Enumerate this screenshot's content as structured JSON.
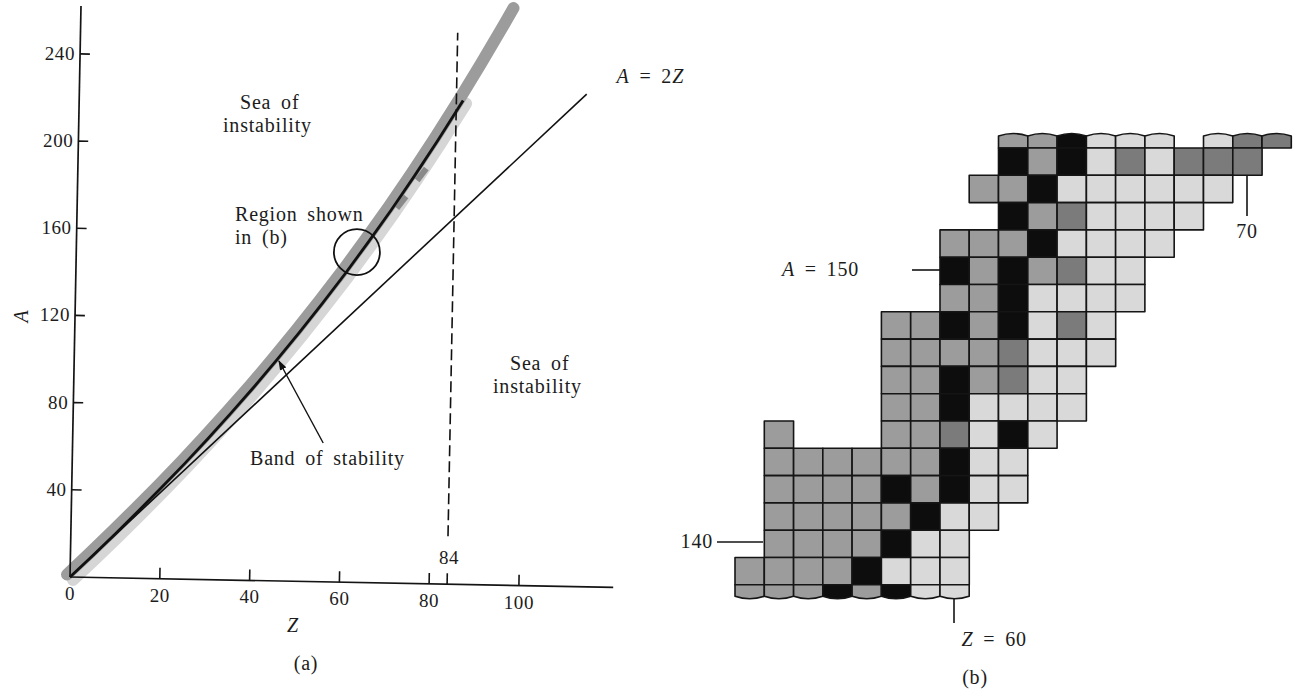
{
  "figure": {
    "panel_a": {
      "caption": "(a)",
      "x_axis_label": "Z",
      "y_axis_label": "A",
      "sea_upper": {
        "line1": "Sea of",
        "line2": "instability"
      },
      "region": {
        "line1": "Region shown",
        "line2": "in (b)"
      },
      "sea_lower": {
        "line1": "Sea of",
        "line2": "instability"
      },
      "band_label": "Band of stability",
      "line_label": {
        "lhs": "A",
        "mid": " = 2",
        "rhs": "Z"
      }
    },
    "panel_b": {
      "caption": "(b)",
      "a150_label": {
        "var": "A",
        "rest": " = 150"
      },
      "a140_label": "140",
      "z60_label": {
        "var": "Z",
        "rest": " = 60"
      },
      "z70_label": "70"
    }
  },
  "chart_data": [
    {
      "id": "a",
      "type": "line",
      "title": "(a)",
      "xlabel": "Z",
      "ylabel": "A",
      "xlim": [
        0,
        121
      ],
      "ylim": [
        0,
        262
      ],
      "grid": false,
      "legend": null,
      "xticks": [
        0,
        20,
        40,
        60,
        80,
        100
      ],
      "xtick_labels": [
        "0",
        "20",
        "40",
        "60",
        "80",
        "100"
      ],
      "extra_xticks": [
        84
      ],
      "extra_xtick_labels": [
        "84"
      ],
      "yticks": [
        40,
        80,
        120,
        160,
        200,
        240
      ],
      "ytick_labels": [
        "40",
        "80",
        "120",
        "160",
        "200",
        "240"
      ],
      "series": [
        {
          "name": "Band of stability",
          "style": "black curve over gray band",
          "color": "#111111",
          "band_color": "#9c9c9c",
          "halo_color": "#d6d6d6",
          "x": [
            0,
            5,
            10,
            15,
            20,
            25,
            30,
            35,
            40,
            45,
            50,
            55,
            60,
            65,
            70,
            75,
            80,
            85.5
          ],
          "y": [
            0,
            10.1,
            20.4,
            31.0,
            41.8,
            52.9,
            64.4,
            76.2,
            88.4,
            101.0,
            114.1,
            127.6,
            141.6,
            156.2,
            171.3,
            187.0,
            203.3,
            222.0
          ]
        },
        {
          "name": "Band of stability (gray band extension)",
          "style": "gray band only",
          "x": [
            90,
            95,
            97
          ],
          "y": [
            237.9,
            256.2,
            263.7
          ]
        },
        {
          "name": "A = 2Z",
          "style": "solid",
          "color": "#111111",
          "x": [
            0,
            113
          ],
          "y": [
            0,
            226
          ]
        },
        {
          "name": "Z = 84",
          "style": "dashed",
          "color": "#111111",
          "x": [
            84,
            84
          ],
          "y": [
            22,
            253
          ]
        }
      ],
      "band_marks": [
        {
          "x": 71.2,
          "y": 172
        },
        {
          "x": 75.6,
          "y": 185
        }
      ],
      "annotations": [
        {
          "text": "Sea of instability",
          "region": "above band"
        },
        {
          "text": "Sea of instability",
          "region": "below A = 2Z"
        },
        {
          "text": "Region shown in (b)",
          "circle": {
            "x": 62.5,
            "y": 151.5,
            "r_px": 23
          }
        },
        {
          "text": "Band of stability",
          "arrow_from": [
            55.8,
            63.7
          ],
          "arrow_to": [
            45.6,
            100.9
          ]
        },
        {
          "text": "A = 2Z",
          "target": "A = 2Z line"
        },
        {
          "text": "84",
          "target": "Z = 84 dashed line"
        }
      ]
    },
    {
      "id": "b",
      "type": "heatmap",
      "title": "(b)",
      "xlabel": "Z",
      "ylabel": "A",
      "z_range": [
        53,
        71
      ],
      "a_range": [
        138,
        155
      ],
      "shade_colors": {
        "K": "#0d0d0d",
        "D": "#7b7b7b",
        "G": "#9c9c9c",
        "L": "#d9d9d9"
      },
      "shade_names": {
        "K": "black",
        "D": "dark gray",
        "G": "gray",
        "L": "light gray"
      },
      "markers": [
        {
          "axis": "A",
          "value": 150,
          "label": "A = 150"
        },
        {
          "axis": "A",
          "value": 140,
          "label": "140"
        },
        {
          "axis": "Z",
          "value": 60,
          "label": "Z = 60"
        },
        {
          "axis": "Z",
          "value": 70,
          "label": "70"
        }
      ],
      "rows": [
        {
          "A": 155,
          "z_start": 62,
          "cells": "GGKLLL.LDD",
          "partial": "top"
        },
        {
          "A": 154,
          "z_start": 62,
          "cells": "KGKLDLDDD"
        },
        {
          "A": 153,
          "z_start": 61,
          "cells": "GGKLLLLLL"
        },
        {
          "A": 152,
          "z_start": 62,
          "cells": "KGDLLLL"
        },
        {
          "A": 151,
          "z_start": 60,
          "cells": "GGGKLLLL"
        },
        {
          "A": 150,
          "z_start": 60,
          "cells": "KGKGDLL"
        },
        {
          "A": 149,
          "z_start": 60,
          "cells": "GGKLLLL"
        },
        {
          "A": 148,
          "z_start": 58,
          "cells": "GGKGKLDL"
        },
        {
          "A": 147,
          "z_start": 58,
          "cells": "GGGGDLLL"
        },
        {
          "A": 146,
          "z_start": 58,
          "cells": "GGKGDLL"
        },
        {
          "A": 145,
          "z_start": 58,
          "cells": "GGKLLLL"
        },
        {
          "A": 144,
          "z_start": 54,
          "cells": "G...GGDLKL"
        },
        {
          "A": 143,
          "z_start": 54,
          "cells": "GGGGGGKLL"
        },
        {
          "A": 142,
          "z_start": 54,
          "cells": "GGGGKGKLL"
        },
        {
          "A": 141,
          "z_start": 54,
          "cells": "GGGGGKLL"
        },
        {
          "A": 140,
          "z_start": 54,
          "cells": "GGGGKLL"
        },
        {
          "A": 139,
          "z_start": 53,
          "cells": "GGGGKLLL"
        },
        {
          "A": 138,
          "z_start": 53,
          "cells": "GGGKGKLL",
          "partial": "bottom"
        }
      ]
    }
  ]
}
